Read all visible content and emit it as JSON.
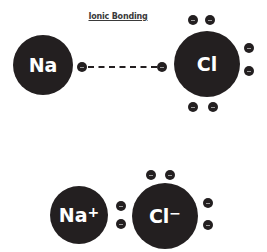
{
  "title": "Ionic Bonding",
  "colors": {
    "atom": "#231f20",
    "text": "#ffffff",
    "background": "#ffffff"
  },
  "top_row": {
    "sodium": {
      "symbol": "Na",
      "cx": 43,
      "cy": 65,
      "r": 30
    },
    "chlorine": {
      "symbol": "Cl",
      "cx": 207,
      "cy": 64,
      "r": 33
    },
    "transfer_line": {
      "from_x": 88,
      "to_x": 157,
      "y": 67
    },
    "electrons": [
      {
        "x": 82,
        "y": 67
      },
      {
        "x": 162,
        "y": 67
      },
      {
        "x": 193,
        "y": 20
      },
      {
        "x": 210,
        "y": 20
      },
      {
        "x": 249,
        "y": 48
      },
      {
        "x": 249,
        "y": 71
      },
      {
        "x": 193,
        "y": 107
      },
      {
        "x": 213,
        "y": 107
      }
    ]
  },
  "bottom_row": {
    "sodium_ion": {
      "symbol": "Na",
      "charge": "+",
      "cx": 79,
      "cy": 215,
      "r": 29
    },
    "chloride_ion": {
      "symbol": "Cl",
      "charge": "−",
      "cx": 165,
      "cy": 216,
      "r": 33
    },
    "electrons": [
      {
        "x": 121,
        "y": 206
      },
      {
        "x": 121,
        "y": 224
      },
      {
        "x": 151,
        "y": 175
      },
      {
        "x": 170,
        "y": 175
      },
      {
        "x": 208,
        "y": 203
      },
      {
        "x": 208,
        "y": 225
      }
    ]
  }
}
